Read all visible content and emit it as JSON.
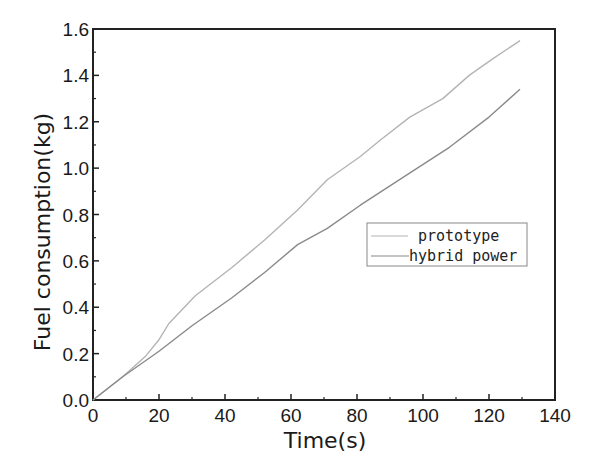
{
  "chart_data": {
    "type": "line",
    "title": "",
    "xlabel": "Time(s)",
    "ylabel": "Fuel consumption(kg)",
    "xlim": [
      0,
      140
    ],
    "ylim": [
      0,
      1.6
    ],
    "xticks": [
      "0",
      "20",
      "40",
      "60",
      "80",
      "100",
      "120",
      "140"
    ],
    "yticks": [
      "0.0",
      "0.2",
      "0.4",
      "0.6",
      "0.8",
      "1.0",
      "1.2",
      "1.4",
      "1.6"
    ],
    "grid": false,
    "legend_position": "center-right",
    "series": [
      {
        "name": "prototype",
        "color": "#b4b4b4",
        "x": [
          0,
          9,
          16,
          20,
          23,
          31,
          42,
          52,
          62,
          71,
          81,
          87,
          96,
          106,
          114,
          121,
          129.4
        ],
        "y": [
          0,
          0.1,
          0.19,
          0.26,
          0.33,
          0.45,
          0.57,
          0.69,
          0.82,
          0.95,
          1.05,
          1.12,
          1.22,
          1.3,
          1.4,
          1.47,
          1.55
        ]
      },
      {
        "name": "hybrid power",
        "color": "#8a8a8a",
        "x": [
          0,
          9,
          20,
          30,
          42,
          52,
          62,
          71,
          81,
          95,
          108,
          120,
          129.4
        ],
        "y": [
          0,
          0.1,
          0.21,
          0.32,
          0.44,
          0.55,
          0.67,
          0.74,
          0.84,
          0.97,
          1.09,
          1.22,
          1.34
        ]
      }
    ]
  }
}
